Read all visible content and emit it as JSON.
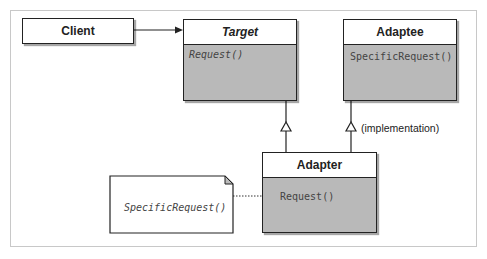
{
  "diagram": {
    "type": "uml-class-diagram",
    "pattern": "Adapter",
    "classes": {
      "client": {
        "name": "Client"
      },
      "target": {
        "name": "Target",
        "operations": [
          "Request()"
        ]
      },
      "adaptee": {
        "name": "Adaptee",
        "operations": [
          "SpecificRequest()"
        ]
      },
      "adapter": {
        "name": "Adapter",
        "operations": [
          "Request()"
        ]
      }
    },
    "note": {
      "text": "SpecificRequest()"
    },
    "relations": [
      {
        "from": "Client",
        "to": "Target",
        "type": "association"
      },
      {
        "from": "Adapter",
        "to": "Target",
        "type": "inheritance"
      },
      {
        "from": "Adapter",
        "to": "Adaptee",
        "type": "inheritance",
        "label": "(implementation)"
      },
      {
        "from": "Adapter.Request()",
        "to": "note",
        "type": "note-link"
      }
    ],
    "colors": {
      "border": "#222222",
      "compartment": "#b9b9b9",
      "header": "#ffffff",
      "frame": "#c8c8c8"
    }
  }
}
